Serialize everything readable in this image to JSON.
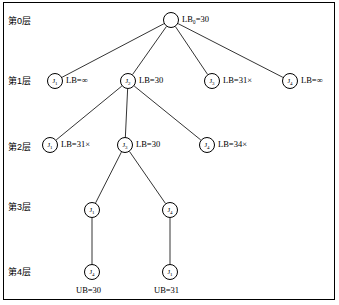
{
  "diagram": {
    "layers": [
      {
        "label": "第0层",
        "x": 8,
        "y": 14
      },
      {
        "label": "第1层",
        "x": 8,
        "y": 74
      },
      {
        "label": "第2层",
        "x": 8,
        "y": 140
      },
      {
        "label": "第3层",
        "x": 8,
        "y": 200
      },
      {
        "label": "第4层",
        "x": 8,
        "y": 265
      }
    ],
    "nodes": [
      {
        "id": "root",
        "name": "node-root",
        "glyph": "",
        "sub": "",
        "cx": 171,
        "cy": 20,
        "label": "LB₀=30",
        "lx": 182,
        "ly": 14
      },
      {
        "id": "n1",
        "name": "node-j1-l1",
        "glyph": "J",
        "sub": "1",
        "cx": 55,
        "cy": 81,
        "label": "LB=∞",
        "lx": 66,
        "ly": 75
      },
      {
        "id": "n2",
        "name": "node-j2-l1",
        "glyph": "J",
        "sub": "2",
        "cx": 128,
        "cy": 81,
        "label": "LB=30",
        "lx": 139,
        "ly": 75
      },
      {
        "id": "n3",
        "name": "node-j3-l1",
        "glyph": "J",
        "sub": "3",
        "cx": 212,
        "cy": 81,
        "label": "LB=31×",
        "lx": 223,
        "ly": 75
      },
      {
        "id": "n4",
        "name": "node-j4-l1",
        "glyph": "J",
        "sub": "4",
        "cx": 290,
        "cy": 81,
        "label": "LB=∞",
        "lx": 301,
        "ly": 75
      },
      {
        "id": "n5",
        "name": "node-j1-l2",
        "glyph": "J",
        "sub": "1",
        "cx": 50,
        "cy": 145,
        "label": "LB=31×",
        "lx": 61,
        "ly": 139
      },
      {
        "id": "n6",
        "name": "node-j3-l2",
        "glyph": "J",
        "sub": "3",
        "cx": 125,
        "cy": 145,
        "label": "LB=30",
        "lx": 136,
        "ly": 139
      },
      {
        "id": "n7",
        "name": "node-j4-l2",
        "glyph": "J",
        "sub": "4",
        "cx": 207,
        "cy": 145,
        "label": "LB=34×",
        "lx": 218,
        "ly": 139
      },
      {
        "id": "n8",
        "name": "node-j1-l3",
        "glyph": "J",
        "sub": "1",
        "cx": 92,
        "cy": 210,
        "label": "",
        "lx": 0,
        "ly": 0
      },
      {
        "id": "n9",
        "name": "node-j4-l3",
        "glyph": "J",
        "sub": "4",
        "cx": 170,
        "cy": 210,
        "label": "",
        "lx": 0,
        "ly": 0
      },
      {
        "id": "n10",
        "name": "node-j4-l4",
        "glyph": "J",
        "sub": "4",
        "cx": 92,
        "cy": 272,
        "label": "",
        "lx": 0,
        "ly": 0
      },
      {
        "id": "n11",
        "name": "node-j1-l4",
        "glyph": "J",
        "sub": "1",
        "cx": 170,
        "cy": 272,
        "label": "",
        "lx": 0,
        "ly": 0
      }
    ],
    "leaf_labels": [
      {
        "name": "leaf-label-ub30",
        "text": "UB=30",
        "x": 76,
        "y": 285
      },
      {
        "name": "leaf-label-ub31",
        "text": "UB=31",
        "x": 154,
        "y": 285
      }
    ],
    "edges": [
      {
        "from": "root",
        "to": "n1"
      },
      {
        "from": "root",
        "to": "n2"
      },
      {
        "from": "root",
        "to": "n3"
      },
      {
        "from": "root",
        "to": "n4"
      },
      {
        "from": "n2",
        "to": "n5"
      },
      {
        "from": "n2",
        "to": "n6"
      },
      {
        "from": "n2",
        "to": "n7"
      },
      {
        "from": "n6",
        "to": "n8"
      },
      {
        "from": "n6",
        "to": "n9"
      },
      {
        "from": "n8",
        "to": "n10"
      },
      {
        "from": "n9",
        "to": "n11"
      }
    ],
    "colors": {
      "stroke": "#000000",
      "background": "#ffffff"
    }
  }
}
